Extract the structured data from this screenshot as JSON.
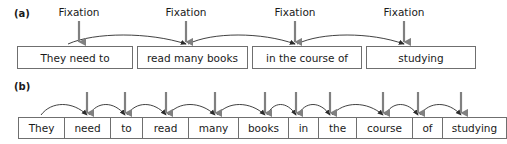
{
  "figure": {
    "background_color": "#ffffff",
    "text_color": "#1a1a1a",
    "box_border_color": "#6f6f6f",
    "arc_color": "#2b2b2b",
    "fixation_arrow_color": "#808080"
  },
  "panel_a": {
    "label": "(a)",
    "fixation_label_text": "Fixation",
    "fixations": [
      {
        "label": "Fixation",
        "x": 79,
        "target_x": 79
      },
      {
        "label": "Fixation",
        "x": 186,
        "target_x": 186
      },
      {
        "label": "Fixation",
        "x": 295,
        "target_x": 295
      },
      {
        "label": "Fixation",
        "x": 404,
        "target_x": 404
      }
    ],
    "chunks": [
      {
        "text": "They need to",
        "x": 17,
        "width": 116
      },
      {
        "text": "read many books",
        "x": 137,
        "width": 111
      },
      {
        "text": "in the course of",
        "x": 252,
        "width": 110
      },
      {
        "text": "studying",
        "x": 366,
        "width": 110
      }
    ],
    "saccades": [
      {
        "from_x": 68,
        "to_x": 186
      },
      {
        "from_x": 188,
        "to_x": 295
      },
      {
        "from_x": 297,
        "to_x": 404
      }
    ]
  },
  "panel_b": {
    "label": "(b)",
    "words": [
      {
        "text": "They",
        "width": 46
      },
      {
        "text": "need",
        "width": 46
      },
      {
        "text": "to",
        "width": 32
      },
      {
        "text": "read",
        "width": 46
      },
      {
        "text": "many",
        "width": 50
      },
      {
        "text": "books",
        "width": 50
      },
      {
        "text": "in",
        "width": 30
      },
      {
        "text": "the",
        "width": 38
      },
      {
        "text": "course",
        "width": 56
      },
      {
        "text": "of",
        "width": 30
      },
      {
        "text": "studying",
        "width": 63
      }
    ],
    "strip_x": 18,
    "strip_y": 117,
    "strip_height": 22,
    "fixation_points": [
      {
        "x": 87
      },
      {
        "x": 125
      },
      {
        "x": 166
      },
      {
        "x": 215
      },
      {
        "x": 265
      },
      {
        "x": 296
      },
      {
        "x": 330
      },
      {
        "x": 383
      },
      {
        "x": 418
      },
      {
        "x": 461
      }
    ],
    "saccades": [
      {
        "from_x": 41,
        "to_x": 87
      },
      {
        "from_x": 89,
        "to_x": 125
      },
      {
        "from_x": 127,
        "to_x": 166
      },
      {
        "from_x": 168,
        "to_x": 215
      },
      {
        "from_x": 217,
        "to_x": 265
      },
      {
        "from_x": 267,
        "to_x": 296
      },
      {
        "from_x": 298,
        "to_x": 330
      },
      {
        "from_x": 332,
        "to_x": 383
      },
      {
        "from_x": 385,
        "to_x": 418
      },
      {
        "from_x": 420,
        "to_x": 461
      }
    ]
  }
}
